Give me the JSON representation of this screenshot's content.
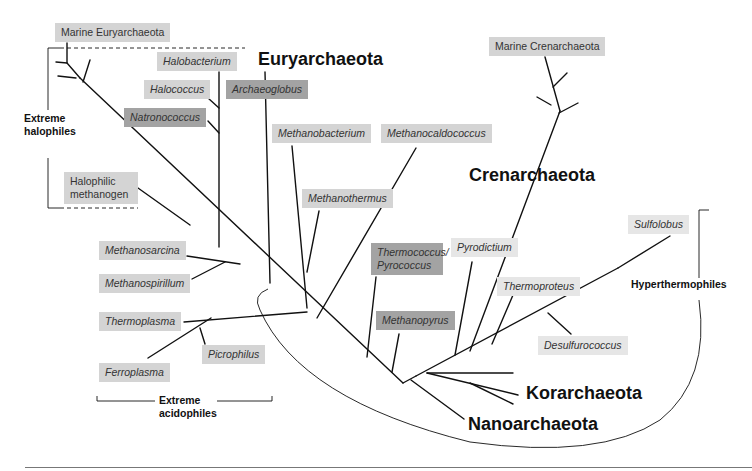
{
  "diagram": {
    "type": "phylogenetic-tree",
    "groups": [
      {
        "id": "euryarchaeota",
        "label": "Euryarchaeota"
      },
      {
        "id": "crenarchaeota",
        "label": "Crenarchaeota"
      },
      {
        "id": "korarchaeota",
        "label": "Korarchaeota"
      },
      {
        "id": "nanoarchaeota",
        "label": "Nanoarchaeota"
      }
    ],
    "taxa": {
      "marine_eury": "Marine Euryarchaeota",
      "halobacterium": "Halobacterium",
      "halococcus": "Halococcus",
      "natronococcus": "Natronococcus",
      "archaeoglobus": "Archaeoglobus",
      "halophilic_methanogen_1": "Halophilic",
      "halophilic_methanogen_2": "methanogen",
      "methanobacterium": "Methanobacterium",
      "methanocaldococcus": "Methanocaldococcus",
      "methanothermus": "Methanothermus",
      "methanosarcina": "Methanosarcina",
      "methanospirillum": "Methanospirillum",
      "thermoplasma": "Thermoplasma",
      "picrophilus": "Picrophilus",
      "ferroplasma": "Ferroplasma",
      "thermococcus_1": "Thermococcus/",
      "thermococcus_2": "Pyrococcus",
      "methanopyrus": "Methanopyrus",
      "pyrodictium": "Pyrodictium",
      "thermoproteus": "Thermoproteus",
      "desulfurococcus": "Desulfurococcus",
      "sulfolobus": "Sulfolobus",
      "marine_cren": "Marine Crenarchaeota"
    },
    "annotations": {
      "extreme_halophiles_1": "Extreme",
      "extreme_halophiles_2": "halophiles",
      "extreme_acidophiles_1": "Extreme",
      "extreme_acidophiles_2": "acidophiles",
      "hyperthermophiles": "Hyperthermophiles"
    },
    "colors": {
      "label_light": "#d4d4d4",
      "label_very_light": "#e6e6e6",
      "label_dark": "#a3a3a3",
      "line": "#111111"
    }
  }
}
